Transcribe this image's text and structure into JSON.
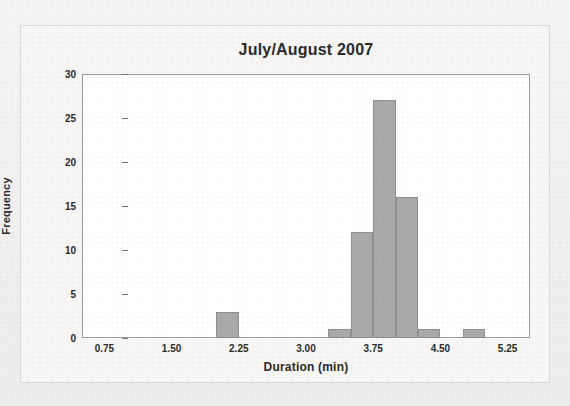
{
  "chart_data": {
    "type": "bar",
    "title": "July/August 2007",
    "xlabel": "Duration (min)",
    "ylabel": "Frequency",
    "xlim": [
      0.5,
      5.5
    ],
    "ylim": [
      0,
      30
    ],
    "grid": false,
    "legend": null,
    "bin_width": 0.25,
    "xticks": [
      "0.75",
      "1.50",
      "2.25",
      "3.00",
      "3.75",
      "4.50",
      "5.25"
    ],
    "xtick_values": [
      0.75,
      1.5,
      2.25,
      3.0,
      3.75,
      4.5,
      5.25
    ],
    "yticks": [
      "0",
      "5",
      "10",
      "15",
      "20",
      "25",
      "30"
    ],
    "ytick_values": [
      0,
      5,
      10,
      15,
      20,
      25,
      30
    ],
    "bars": [
      {
        "bin_start": 2.0,
        "bin_end": 2.25,
        "value": 3
      },
      {
        "bin_start": 3.25,
        "bin_end": 3.5,
        "value": 1
      },
      {
        "bin_start": 3.5,
        "bin_end": 3.75,
        "value": 12
      },
      {
        "bin_start": 3.75,
        "bin_end": 4.0,
        "value": 27
      },
      {
        "bin_start": 4.0,
        "bin_end": 4.25,
        "value": 16
      },
      {
        "bin_start": 4.25,
        "bin_end": 4.5,
        "value": 1
      },
      {
        "bin_start": 4.75,
        "bin_end": 5.0,
        "value": 1
      }
    ],
    "categories": [
      "2.00-2.25",
      "3.25-3.50",
      "3.50-3.75",
      "3.75-4.00",
      "4.00-4.25",
      "4.25-4.50",
      "4.75-5.00"
    ],
    "values": [
      3,
      1,
      12,
      27,
      16,
      1,
      1
    ],
    "bar_color": "#a9a9a9",
    "bar_edge_color": "#8f8f8f",
    "axis_color": "#9a9a9a",
    "text_color": "#2b2b2b",
    "plot_background": "#ffffff",
    "figure_background": "#f7f6f5"
  }
}
